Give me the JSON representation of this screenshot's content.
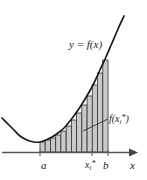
{
  "figure": {
    "watermark": "",
    "colors": {
      "curve": "#1a1a1a",
      "axis": "#555555",
      "rect_fill": "#c9c9c9",
      "rect_stroke": "#333333",
      "label_text": "#1a1a1a",
      "background": "#ffffff"
    },
    "labels": {
      "curve_equation": "y = f(x)",
      "rect_height": "f(x",
      "rect_height_sub": "i",
      "rect_height_sup": "*",
      "rect_height_close": ")",
      "left_endpoint": "a",
      "sample_point": "x",
      "sample_point_sub": "i",
      "sample_point_sup": "*",
      "right_endpoint": "b",
      "x_axis": "x"
    }
  },
  "chart_data": {
    "type": "area",
    "xlabel": "x",
    "ylabel": "y",
    "grid": false,
    "legend": null,
    "axis_style": {
      "x_axis_arrow": true,
      "y_axis_shown": false,
      "x_axis_y_px": 152
    },
    "annotations": [
      {
        "text": "y = f(x)",
        "target": "curve",
        "x_px": 69,
        "y_px": 38
      },
      {
        "text": "f(xi*)",
        "target": "rectangle-height",
        "x_px": 109,
        "y_px": 113,
        "leader_line": {
          "from_x": 109,
          "from_y": 120,
          "to_x": 84,
          "to_y": 130
        }
      },
      {
        "text": "a",
        "target": "x-axis-tick",
        "x_px": 41,
        "y_px": 159
      },
      {
        "text": "xi*",
        "target": "x-axis-tick",
        "x_px": 85,
        "y_px": 159
      },
      {
        "text": "b",
        "target": "x-axis-tick",
        "x_px": 103,
        "y_px": 159
      },
      {
        "text": "x",
        "target": "x-axis-label",
        "x_px": 130,
        "y_px": 159
      }
    ],
    "interval": {
      "a": 40,
      "b": 108,
      "n_rectangles": 13
    },
    "curve_description": "Upward-opening convex curve (parabola-like), decreasing to a minimum near x=30 then increasing steeply to the upper right",
    "curve_points_px": [
      {
        "x": 2,
        "y": 118
      },
      {
        "x": 8,
        "y": 124
      },
      {
        "x": 14,
        "y": 130
      },
      {
        "x": 20,
        "y": 136
      },
      {
        "x": 27,
        "y": 140
      },
      {
        "x": 34,
        "y": 142
      },
      {
        "x": 40,
        "y": 142
      },
      {
        "x": 46,
        "y": 140
      },
      {
        "x": 52,
        "y": 137
      },
      {
        "x": 58,
        "y": 133
      },
      {
        "x": 64,
        "y": 128
      },
      {
        "x": 70,
        "y": 121
      },
      {
        "x": 76,
        "y": 113
      },
      {
        "x": 82,
        "y": 104
      },
      {
        "x": 88,
        "y": 94
      },
      {
        "x": 94,
        "y": 83
      },
      {
        "x": 100,
        "y": 70
      },
      {
        "x": 106,
        "y": 57
      },
      {
        "x": 112,
        "y": 43
      },
      {
        "x": 118,
        "y": 29
      },
      {
        "x": 124,
        "y": 16
      }
    ],
    "rectangles_px": [
      {
        "x": 40.0,
        "width": 5.23,
        "top": 142,
        "bottom": 152
      },
      {
        "x": 45.2,
        "width": 5.23,
        "top": 140,
        "bottom": 152
      },
      {
        "x": 50.5,
        "width": 5.23,
        "top": 138,
        "bottom": 152
      },
      {
        "x": 55.7,
        "width": 5.23,
        "top": 135,
        "bottom": 152
      },
      {
        "x": 60.9,
        "width": 5.23,
        "top": 131,
        "bottom": 152
      },
      {
        "x": 66.2,
        "width": 5.23,
        "top": 126,
        "bottom": 152
      },
      {
        "x": 71.4,
        "width": 5.23,
        "top": 120,
        "bottom": 152
      },
      {
        "x": 76.6,
        "width": 5.23,
        "top": 113,
        "bottom": 152
      },
      {
        "x": 81.8,
        "width": 5.23,
        "top": 105,
        "bottom": 152
      },
      {
        "x": 87.1,
        "width": 5.23,
        "top": 96,
        "bottom": 152
      },
      {
        "x": 92.3,
        "width": 5.23,
        "top": 85,
        "bottom": 152
      },
      {
        "x": 97.5,
        "width": 5.23,
        "top": 73,
        "bottom": 152
      },
      {
        "x": 102.8,
        "width": 5.23,
        "top": 60,
        "bottom": 152
      }
    ]
  }
}
